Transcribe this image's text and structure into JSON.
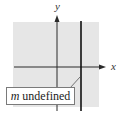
{
  "diagram": {
    "axes": {
      "x_label": "x",
      "y_label": "y"
    },
    "annotation": {
      "variable": "m",
      "text": " undefined"
    },
    "colors": {
      "background": "#e6e6e6",
      "axis": "#2a2a2a",
      "line": "#111111"
    },
    "line_type": "vertical"
  }
}
